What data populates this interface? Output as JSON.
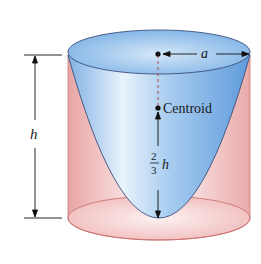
{
  "figure": {
    "labels": {
      "radius": "a",
      "height": "h",
      "centroid": "Centroid",
      "fraction_numerator": "2",
      "fraction_denominator": "3",
      "fraction_variable": "h"
    },
    "colors": {
      "paraboloid_blue": "#8fbbe8",
      "paraboloid_light": "#e6f1fb",
      "cylinder_pink": "#f2c1c1",
      "cylinder_edge": "#c96a6a",
      "outline_dark": "#3a4f7a",
      "text": "#1a1a1a"
    }
  }
}
